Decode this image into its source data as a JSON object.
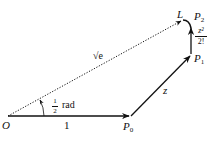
{
  "diagram": {
    "type": "vector-spiral",
    "colors": {
      "stroke": "#111111",
      "background": "#ffffff"
    },
    "points": {
      "O": {
        "label": "O",
        "x": 8,
        "y": 116
      },
      "P0": {
        "label": "P",
        "sub": "0",
        "x": 130,
        "y": 116
      },
      "P1": {
        "label": "P",
        "sub": "1",
        "x": 191,
        "y": 54
      },
      "P2": {
        "label": "P",
        "sub": "2",
        "x": 191,
        "y": 28
      },
      "L": {
        "label": "L",
        "x": 183,
        "y": 20
      }
    },
    "edges": [
      {
        "from": "O",
        "to": "P0",
        "label": "1",
        "style": "solid",
        "arrow": true
      },
      {
        "from": "P0",
        "to": "P1",
        "label": "z",
        "style": "solid",
        "arrow": true
      },
      {
        "from": "P1",
        "to": "P2",
        "label_num": "z²",
        "label_den": "2!",
        "style": "solid",
        "arrow": true
      },
      {
        "from": "O",
        "to": "L",
        "label": "√e",
        "style": "dotted",
        "arrow": true
      }
    ],
    "angle": {
      "num": "1",
      "den": "2",
      "unit": "rad"
    }
  }
}
